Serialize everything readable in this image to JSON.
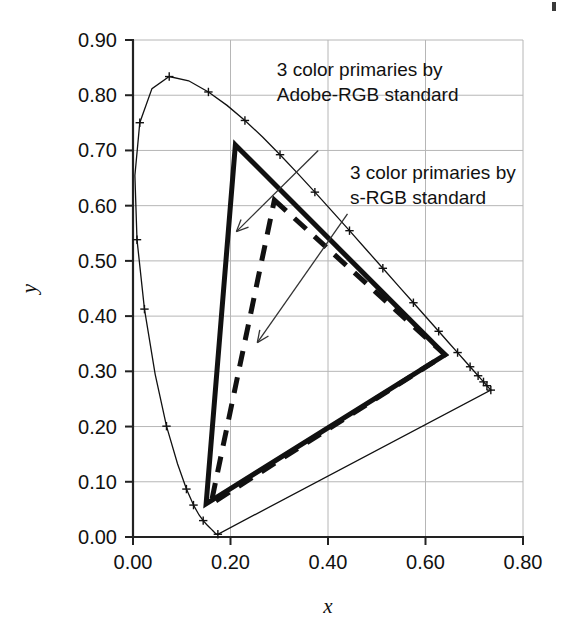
{
  "chart_data": {
    "type": "line",
    "title": "",
    "xlabel": "x",
    "ylabel": "y",
    "xlim": [
      0.0,
      0.8
    ],
    "ylim": [
      0.0,
      0.9
    ],
    "xticks": [
      "0.00",
      "0.20",
      "0.40",
      "0.60",
      "0.80"
    ],
    "xtick_values": [
      0.0,
      0.2,
      0.4,
      0.6,
      0.8
    ],
    "yticks": [
      "0.00",
      "0.10",
      "0.20",
      "0.30",
      "0.40",
      "0.50",
      "0.60",
      "0.70",
      "0.80",
      "0.90"
    ],
    "ytick_values": [
      0.0,
      0.1,
      0.2,
      0.3,
      0.4,
      0.5,
      0.6,
      0.7,
      0.8,
      0.9
    ],
    "grid": true,
    "legend": "none",
    "series": [
      {
        "name": "spectral-locus",
        "style": "thin-solid-with-plus-markers",
        "closed": true,
        "points": [
          [
            0.1741,
            0.005
          ],
          [
            0.174,
            0.005
          ],
          [
            0.1738,
            0.0049
          ],
          [
            0.1736,
            0.0049
          ],
          [
            0.1733,
            0.0048
          ],
          [
            0.173,
            0.0048
          ],
          [
            0.1726,
            0.0048
          ],
          [
            0.1721,
            0.0048
          ],
          [
            0.1714,
            0.0051
          ],
          [
            0.1703,
            0.0058
          ],
          [
            0.1689,
            0.0069
          ],
          [
            0.1669,
            0.0086
          ],
          [
            0.1644,
            0.0109
          ],
          [
            0.1611,
            0.0138
          ],
          [
            0.1566,
            0.0177
          ],
          [
            0.151,
            0.0227
          ],
          [
            0.144,
            0.0297
          ],
          [
            0.1355,
            0.0399
          ],
          [
            0.1241,
            0.0578
          ],
          [
            0.1096,
            0.0868
          ],
          [
            0.0913,
            0.1327
          ],
          [
            0.0687,
            0.2007
          ],
          [
            0.0454,
            0.295
          ],
          [
            0.0235,
            0.4127
          ],
          [
            0.0082,
            0.5384
          ],
          [
            0.0039,
            0.6548
          ],
          [
            0.0139,
            0.7502
          ],
          [
            0.0389,
            0.812
          ],
          [
            0.0743,
            0.8338
          ],
          [
            0.1142,
            0.8262
          ],
          [
            0.1547,
            0.8059
          ],
          [
            0.1929,
            0.7816
          ],
          [
            0.2296,
            0.7543
          ],
          [
            0.2658,
            0.7243
          ],
          [
            0.3016,
            0.6923
          ],
          [
            0.3373,
            0.6589
          ],
          [
            0.3731,
            0.6245
          ],
          [
            0.4087,
            0.5896
          ],
          [
            0.4441,
            0.5547
          ],
          [
            0.4788,
            0.5202
          ],
          [
            0.5125,
            0.4866
          ],
          [
            0.5448,
            0.4544
          ],
          [
            0.5752,
            0.4242
          ],
          [
            0.6029,
            0.3965
          ],
          [
            0.627,
            0.3725
          ],
          [
            0.6482,
            0.3514
          ],
          [
            0.6658,
            0.334
          ],
          [
            0.6801,
            0.3197
          ],
          [
            0.6915,
            0.3083
          ],
          [
            0.7006,
            0.2993
          ],
          [
            0.7079,
            0.292
          ],
          [
            0.714,
            0.2859
          ],
          [
            0.719,
            0.2809
          ],
          [
            0.723,
            0.277
          ],
          [
            0.726,
            0.274
          ],
          [
            0.7283,
            0.2717
          ],
          [
            0.73,
            0.27
          ],
          [
            0.7311,
            0.2689
          ],
          [
            0.732,
            0.268
          ],
          [
            0.7327,
            0.2673
          ],
          [
            0.7334,
            0.2666
          ],
          [
            0.734,
            0.266
          ]
        ],
        "marker_points": [
          [
            0.1741,
            0.005
          ],
          [
            0.144,
            0.0297
          ],
          [
            0.1241,
            0.0578
          ],
          [
            0.1096,
            0.0868
          ],
          [
            0.0687,
            0.2007
          ],
          [
            0.0235,
            0.4127
          ],
          [
            0.0082,
            0.5384
          ],
          [
            0.0139,
            0.7502
          ],
          [
            0.0743,
            0.8338
          ],
          [
            0.1547,
            0.8059
          ],
          [
            0.2296,
            0.7543
          ],
          [
            0.3016,
            0.6923
          ],
          [
            0.3731,
            0.6245
          ],
          [
            0.4441,
            0.5547
          ],
          [
            0.5125,
            0.4866
          ],
          [
            0.5752,
            0.4242
          ],
          [
            0.627,
            0.3725
          ],
          [
            0.6658,
            0.334
          ],
          [
            0.6915,
            0.3083
          ],
          [
            0.7079,
            0.292
          ],
          [
            0.719,
            0.2809
          ],
          [
            0.726,
            0.274
          ],
          [
            0.734,
            0.266
          ]
        ]
      },
      {
        "name": "adobe-rgb-gamut",
        "style": "bold-solid",
        "closed": true,
        "points": [
          [
            0.21,
            0.71
          ],
          [
            0.64,
            0.33
          ],
          [
            0.15,
            0.06
          ]
        ]
      },
      {
        "name": "srgb-gamut",
        "style": "bold-dashed",
        "closed": true,
        "points": [
          [
            0.29,
            0.61
          ],
          [
            0.64,
            0.33
          ],
          [
            0.16,
            0.06
          ]
        ]
      }
    ],
    "annotations": [
      {
        "name": "adobe-rgb-annotation",
        "lines": [
          "3 color primaries by",
          "Adobe-RGB standard"
        ],
        "text_x": 0.295,
        "text_y": 0.835,
        "arrow_from": [
          0.38,
          0.7
        ],
        "arrow_to": [
          0.212,
          0.553
        ]
      },
      {
        "name": "srgb-annotation",
        "lines": [
          "3 color primaries by",
          "s-RGB standard"
        ],
        "text_x": 0.445,
        "text_y": 0.648,
        "arrow_from": [
          0.44,
          0.585
        ],
        "arrow_to": [
          0.255,
          0.352
        ]
      }
    ]
  }
}
